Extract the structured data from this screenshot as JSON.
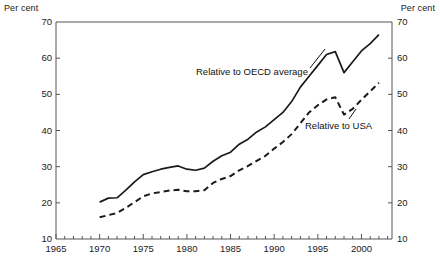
{
  "axis_units": {
    "left": "Per cent",
    "right": "Per cent"
  },
  "y_ticks": [
    "70",
    "60",
    "50",
    "40",
    "30",
    "20",
    "10"
  ],
  "x_ticks": [
    "1965",
    "1970",
    "1975",
    "1980",
    "1985",
    "1990",
    "1995",
    "2000"
  ],
  "series_labels": {
    "oecd": "Relative to OECD average",
    "usa": "Relative to USA"
  },
  "colors": {
    "line": "#1a1a1a",
    "axis": "#555555",
    "background": "#ffffff"
  },
  "chart_data": {
    "type": "line",
    "title": "",
    "subtitle": "",
    "xlabel": "",
    "ylabel": "Per cent",
    "xlim": [
      1965,
      2003.5
    ],
    "ylim": [
      10,
      70
    ],
    "grid": false,
    "legend": "inline-annotations",
    "y_unit": "Per cent",
    "y_tick_values": [
      10,
      20,
      30,
      40,
      50,
      60,
      70
    ],
    "x_tick_values": [
      1965,
      1970,
      1975,
      1980,
      1985,
      1990,
      1995,
      2000
    ],
    "x_minor_tick_interval": 1,
    "x": [
      1970,
      1971,
      1972,
      1973,
      1974,
      1975,
      1976,
      1977,
      1978,
      1979,
      1980,
      1981,
      1982,
      1983,
      1984,
      1985,
      1986,
      1987,
      1988,
      1989,
      1990,
      1991,
      1992,
      1993,
      1994,
      1995,
      1996,
      1997,
      1998,
      1999,
      2000,
      2001,
      2002
    ],
    "series": [
      {
        "name": "Relative to OECD average",
        "style": "solid",
        "values": [
          20.2,
          21.3,
          21.4,
          23.5,
          25.8,
          27.8,
          28.6,
          29.3,
          29.8,
          30.2,
          29.3,
          29.0,
          29.6,
          31.5,
          33.0,
          34.0,
          36.2,
          37.6,
          39.6,
          41.0,
          43.0,
          45.0,
          48.0,
          52.0,
          55.0,
          58.0,
          61.0,
          61.8,
          56.0,
          59.0,
          62.0,
          64.0,
          66.5
        ]
      },
      {
        "name": "Relative to USA",
        "style": "dashed",
        "values": [
          16.0,
          16.6,
          17.2,
          18.6,
          20.2,
          21.8,
          22.6,
          23.0,
          23.4,
          23.6,
          23.2,
          23.2,
          23.5,
          25.5,
          26.6,
          27.4,
          29.0,
          30.2,
          31.6,
          33.0,
          35.0,
          36.8,
          39.0,
          42.0,
          45.0,
          47.0,
          48.6,
          49.2,
          44.4,
          46.0,
          48.5,
          50.8,
          53.2
        ]
      }
    ]
  }
}
